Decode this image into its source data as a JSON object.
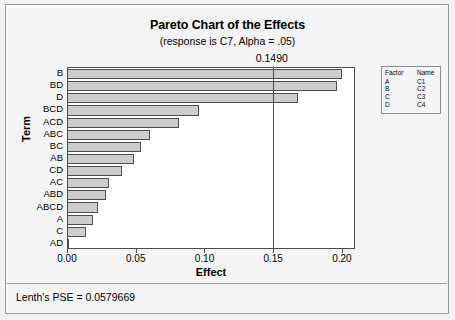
{
  "chart_data": {
    "type": "bar",
    "orientation": "horizontal",
    "title": "Pareto Chart of the Effects",
    "subtitle": "(response is C7, Alpha = .05)",
    "xlabel": "Effect",
    "ylabel": "Term",
    "xlim": [
      0.0,
      0.2095
    ],
    "grid": false,
    "categories": [
      "B",
      "BD",
      "D",
      "BCD",
      "ACD",
      "ABC",
      "BC",
      "AB",
      "CD",
      "AC",
      "ABD",
      "ABCD",
      "A",
      "C",
      "AD"
    ],
    "values": [
      0.199,
      0.196,
      0.167,
      0.095,
      0.081,
      0.06,
      0.053,
      0.048,
      0.039,
      0.03,
      0.028,
      0.022,
      0.018,
      0.013,
      0.001
    ],
    "xticks": [
      "0.00",
      "0.05",
      "0.10",
      "0.15",
      "0.20"
    ],
    "xtick_values": [
      0.0,
      0.05,
      0.1,
      0.15,
      0.2
    ],
    "reference_line": {
      "label": "0.1490",
      "value": 0.149
    },
    "legend": {
      "position": "right",
      "headers": [
        "Factor",
        "Name"
      ],
      "rows": [
        {
          "factor": "A",
          "name": "C1"
        },
        {
          "factor": "B",
          "name": "C2"
        },
        {
          "factor": "C",
          "name": "C3"
        },
        {
          "factor": "D",
          "name": "C4"
        }
      ]
    },
    "footnote": "Lenth's PSE = 0.0579669",
    "colors": {
      "bar_fill": "#cccccc",
      "bar_border": "#4d4d4d",
      "plot_background": "#ffffff",
      "window_background": "#f4f4f4",
      "text": "#000000"
    }
  }
}
